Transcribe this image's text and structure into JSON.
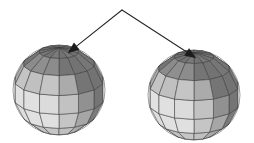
{
  "figure": {
    "background": "#ffffff",
    "width": 254,
    "height": 143,
    "render_style": "flat-shaded faceted polyhedral sphere, grayscale",
    "edge_color": "#3a3a3a",
    "pointer_color": "#262626"
  },
  "shading": {
    "light_direction_label": "upper-left",
    "palette": {
      "highlight": "#f2f2f2",
      "light": "#e0e0e0",
      "mid_light": "#c4c4c4",
      "mid": "#a8a8a8",
      "mid_dark": "#8d8d8d",
      "dark": "#757575",
      "darkest": "#5e5e5e"
    },
    "band_tints": [
      1.0,
      0.97,
      0.9,
      0.78,
      0.66
    ],
    "band_labels": [
      "polar-cap",
      "upper-band",
      "equator-upper",
      "equator-lower",
      "lower-band"
    ]
  },
  "spheres": [
    {
      "name": "sphere-left",
      "cx": 59,
      "cy": 90,
      "rx": 46,
      "ry": 45,
      "lat_segments": 7,
      "lon_segments": 14,
      "tilt_deg": 20,
      "pole_x": 59,
      "pole_y": 48
    },
    {
      "name": "sphere-right",
      "cx": 194,
      "cy": 95,
      "rx": 46,
      "ry": 45,
      "lat_segments": 7,
      "lon_segments": 14,
      "tilt_deg": 20,
      "pole_x": 194,
      "pole_y": 53
    }
  ],
  "pointers": {
    "apex": {
      "x": 122,
      "y": 10
    },
    "arrows": [
      {
        "name": "pointer-left",
        "to_x": 68,
        "to_y": 53,
        "target": "sphere-left-pole"
      },
      {
        "name": "pointer-right",
        "to_x": 196,
        "to_y": 58,
        "target": "sphere-right-pole"
      }
    ],
    "arrowhead_length": 11,
    "arrowhead_width": 4.2
  }
}
